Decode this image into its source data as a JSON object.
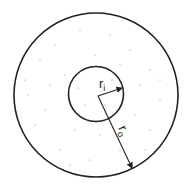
{
  "diagram": {
    "type": "concentric-circles-annulus",
    "labels": {
      "inner_radius": "r",
      "inner_radius_sub": "i",
      "outer_radius": "r",
      "outer_radius_sub": "o"
    },
    "colors": {
      "stroke": "#222222",
      "background": "#ffffff",
      "stipple": "#777777"
    }
  }
}
